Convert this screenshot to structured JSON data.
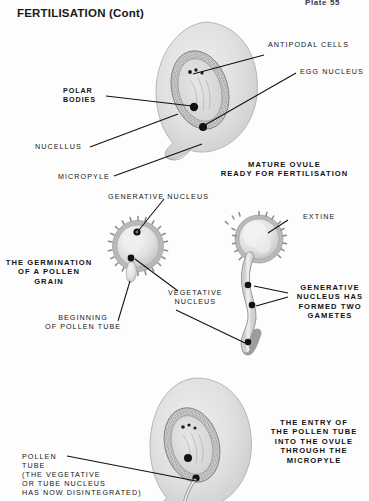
{
  "page": {
    "plate_number": "Plate 55",
    "title": "FERTILISATION (Cont)",
    "background_color": "#fdfdfd",
    "ink_color": "#141414"
  },
  "figures": [
    {
      "id": "mature-ovule",
      "caption": "MATURE OVULE\nREADY FOR FERTILISATION",
      "labels": [
        {
          "id": "antipodal-cells",
          "text": "ANTIPODAL CELLS",
          "bold": false
        },
        {
          "id": "egg-nucleus",
          "text": "EGG NUCLEUS",
          "bold": false
        },
        {
          "id": "polar-bodies",
          "text": "POLAR\nBODIES",
          "bold": true
        },
        {
          "id": "nucellus",
          "text": "NUCELLUS",
          "bold": false
        },
        {
          "id": "micropyle",
          "text": "MICROPYLE",
          "bold": false
        }
      ]
    },
    {
      "id": "pollen-grain-germination",
      "caption": "THE GERMINATION\nOF A POLLEN\nGRAIN",
      "labels": [
        {
          "id": "generative-nucleus",
          "text": "GENERATIVE NUCLEUS",
          "bold": false
        },
        {
          "id": "vegetative-nucleus",
          "text": "VEGETATIVE\nNUCLEUS",
          "bold": false
        },
        {
          "id": "beginning-of-pollen-tube",
          "text": "BEGINNING\nOF POLLEN TUBE",
          "bold": false
        }
      ]
    },
    {
      "id": "pollen-tube-gametes",
      "caption": "GENERATIVE\nNUCLEUS HAS\nFORMED TWO\nGAMETES",
      "labels": [
        {
          "id": "extine",
          "text": "EXTINE",
          "bold": false
        }
      ]
    },
    {
      "id": "pollen-tube-entry",
      "caption": "THE ENTRY OF\nTHE POLLEN TUBE\nINTO THE OVULE\nTHROUGH THE\nMICROPYLE",
      "labels": [
        {
          "id": "pollen-tube",
          "text": "POLLEN\nTUBE\n(THE VEGETATIVE\nOR TUBE NUCLEUS\nHAS NOW DISINTEGRATED)",
          "bold": false
        }
      ]
    }
  ]
}
